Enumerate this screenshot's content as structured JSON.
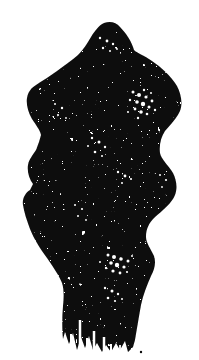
{
  "page": {
    "type": "scanned-figure",
    "background_color": "#ffffff"
  },
  "figure": {
    "ink_color": "#0b0b0b",
    "paper_color": "#ffffff",
    "silhouette_path": "M 104 23 C 110 21 116 22 120 27 C 126 33 132 42 134 50 C 137 53 145 56 152 61 C 161 67 171 76 177 86 C 181 94 183 103 180 111 C 177 118 171 124 165 131 C 161 137 159 145 160 153 C 161 159 168 165 173 173 C 176 179 178 187 175 195 C 172 203 163 210 154 218 C 149 223 146 229 146 237 C 146 243 151 249 154 256 C 156 262 155 269 151 276 C 147 285 143 295 141 305 C 139 316 137 328 135 340 L 133 347 L 128 352 L 125 341 L 120 350 L 116 343 L 111 352 L 106 345 L 102 352 L 97 343 L 93 350 L 89 336 L 85 348 L 81 337 L 77 350 L 73 333 L 69 344 L 65 332 L 63 339 C 62 330 62 317 63 306 C 64 297 64 289 62 283 C 59 275 53 267 47 258 C 41 250 34 239 30 229 C 27 221 24 212 23 205 C 22 199 25 193 30 190 L 33 184 C 29 179 27 171 28 165 C 29 159 33 155 36 150 L 39 142 L 41 135 C 40 130 36 125 32 119 C 28 112 26 104 27 98 C 28 92 31 88 36 85 C 42 81 50 76 57 71 C 64 66 72 60 78 55 C 83 50 87 44 91 37 C 94 32 99 25 104 23 Z",
    "white_flecks": [
      [
        133,
        92,
        1.5
      ],
      [
        139,
        95,
        2
      ],
      [
        146,
        97,
        1.6
      ],
      [
        152,
        101,
        1.4
      ],
      [
        137,
        102,
        1.8
      ],
      [
        143,
        104,
        2.2
      ],
      [
        149,
        107,
        1.5
      ],
      [
        135,
        109,
        1.4
      ],
      [
        141,
        112,
        1.8
      ],
      [
        147,
        114,
        1.3
      ],
      [
        130,
        100,
        1.2
      ],
      [
        144,
        90,
        1.2
      ],
      [
        151,
        93,
        1
      ],
      [
        155,
        110,
        1.2
      ],
      [
        138,
        118,
        1.2
      ],
      [
        128,
        112,
        1
      ],
      [
        108,
        255,
        1.5
      ],
      [
        114,
        257,
        2
      ],
      [
        121,
        259,
        1.8
      ],
      [
        128,
        261,
        1.5
      ],
      [
        111,
        263,
        1.8
      ],
      [
        117,
        265,
        2.2
      ],
      [
        124,
        267,
        1.6
      ],
      [
        106,
        268,
        1.2
      ],
      [
        113,
        271,
        1.6
      ],
      [
        120,
        273,
        1.4
      ],
      [
        127,
        272,
        1.1
      ],
      [
        100,
        262,
        1
      ],
      [
        132,
        256,
        1
      ],
      [
        92,
        138,
        1.2
      ],
      [
        99,
        142,
        1.5
      ],
      [
        105,
        147,
        1.2
      ],
      [
        95,
        152,
        1.3
      ],
      [
        102,
        156,
        1
      ],
      [
        88,
        146,
        1
      ],
      [
        105,
        288,
        1.2
      ],
      [
        112,
        291,
        1.5
      ],
      [
        118,
        294,
        1.2
      ],
      [
        108,
        298,
        1.3
      ],
      [
        115,
        301,
        1.1
      ],
      [
        122,
        299,
        1
      ],
      [
        100,
        38,
        1.2
      ],
      [
        107,
        41,
        1.4
      ],
      [
        113,
        44,
        1.2
      ],
      [
        103,
        48,
        1.2
      ],
      [
        110,
        51,
        1
      ],
      [
        117,
        49,
        0.9
      ],
      [
        55,
        104,
        1
      ],
      [
        62,
        108,
        1.2
      ],
      [
        58,
        115,
        1.1
      ],
      [
        66,
        118,
        0.9
      ],
      [
        160,
        175,
        1
      ],
      [
        166,
        180,
        1.1
      ],
      [
        162,
        187,
        0.9
      ],
      [
        75,
        205,
        1
      ],
      [
        82,
        209,
        1.1
      ],
      [
        78,
        216,
        1
      ],
      [
        86,
        220,
        0.9
      ],
      [
        118,
        172,
        1.2
      ],
      [
        125,
        176,
        1.4
      ],
      [
        131,
        179,
        1.1
      ],
      [
        122,
        183,
        1
      ]
    ],
    "fringe_slits": [
      [
        80,
        352,
        320,
        2.5
      ],
      [
        87,
        351,
        338,
        2
      ],
      [
        94,
        353,
        331,
        2.5
      ],
      [
        104,
        354,
        337,
        2.5
      ],
      [
        71,
        349,
        334,
        2
      ],
      [
        111,
        353,
        344,
        2
      ],
      [
        120,
        352,
        345,
        1.8
      ]
    ],
    "stray_marks": [
      [
        141,
        352,
        1.2
      ]
    ]
  }
}
